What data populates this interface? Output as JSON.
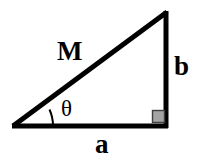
{
  "figure": {
    "background_color": "#ffffff",
    "stroke_color": "#000000",
    "right_angle_fill": "#a3a3a3",
    "right_angle_stroke": "#3f3f3f",
    "labels": {
      "hypotenuse": "M",
      "opposite_leg": "b",
      "adjacent_leg": "a",
      "angle": "θ"
    },
    "geometry": {
      "vertex_left": [
        13,
        126
      ],
      "vertex_top_right": [
        166,
        13
      ],
      "vertex_bottom_right": [
        166,
        126
      ],
      "line_width": 5,
      "arc_radius": 40,
      "arc_line_width": 2,
      "right_angle_square_size": 14
    }
  }
}
